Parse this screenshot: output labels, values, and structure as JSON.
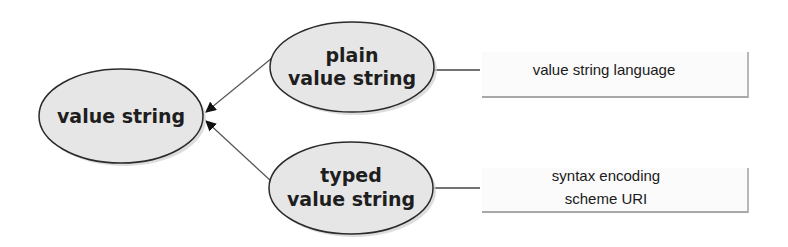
{
  "diagram": {
    "type": "concept-map",
    "nodes": {
      "root": {
        "lines": [
          "value string"
        ]
      },
      "plain": {
        "lines": [
          "plain",
          "value string"
        ]
      },
      "typed": {
        "lines": [
          "typed",
          "value string"
        ]
      },
      "language": {
        "lines": [
          "value string language"
        ]
      },
      "syntax": {
        "lines": [
          "syntax encoding",
          "scheme URI"
        ]
      }
    },
    "edges": [
      {
        "from": "plain",
        "to": "root",
        "style": "arrow"
      },
      {
        "from": "typed",
        "to": "root",
        "style": "arrow"
      },
      {
        "from": "plain",
        "to": "language",
        "style": "line"
      },
      {
        "from": "typed",
        "to": "syntax",
        "style": "line"
      }
    ],
    "colors": {
      "ellipse_fill": "#e6e6e6",
      "ellipse_stroke": "#2a2a2a",
      "ellipse_shadow": "#c8c8c8",
      "connector": "#555555",
      "box_border": "#a0a0a0"
    }
  }
}
